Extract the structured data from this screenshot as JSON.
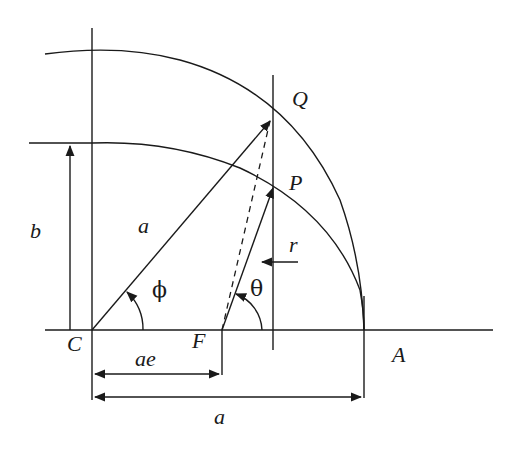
{
  "diagram": {
    "geometry_note": "Coordinates are estimated from pixel measurements of the screenshot. The ellipse is fitted to measured endpoints, not derived from a source equation.",
    "points": {
      "C": "C",
      "F": "F",
      "A": "A",
      "P": "P",
      "Q": "Q"
    },
    "labels": {
      "semi_major_radius": "a",
      "semi_minor": "b",
      "focal_distance": "ae",
      "semi_major_dimension": "a",
      "radius_vector": "r",
      "eccentric_anomaly": "ϕ",
      "true_anomaly": "θ"
    },
    "colors": {
      "ink": "#1a1a1a",
      "background": "#ffffff"
    }
  }
}
